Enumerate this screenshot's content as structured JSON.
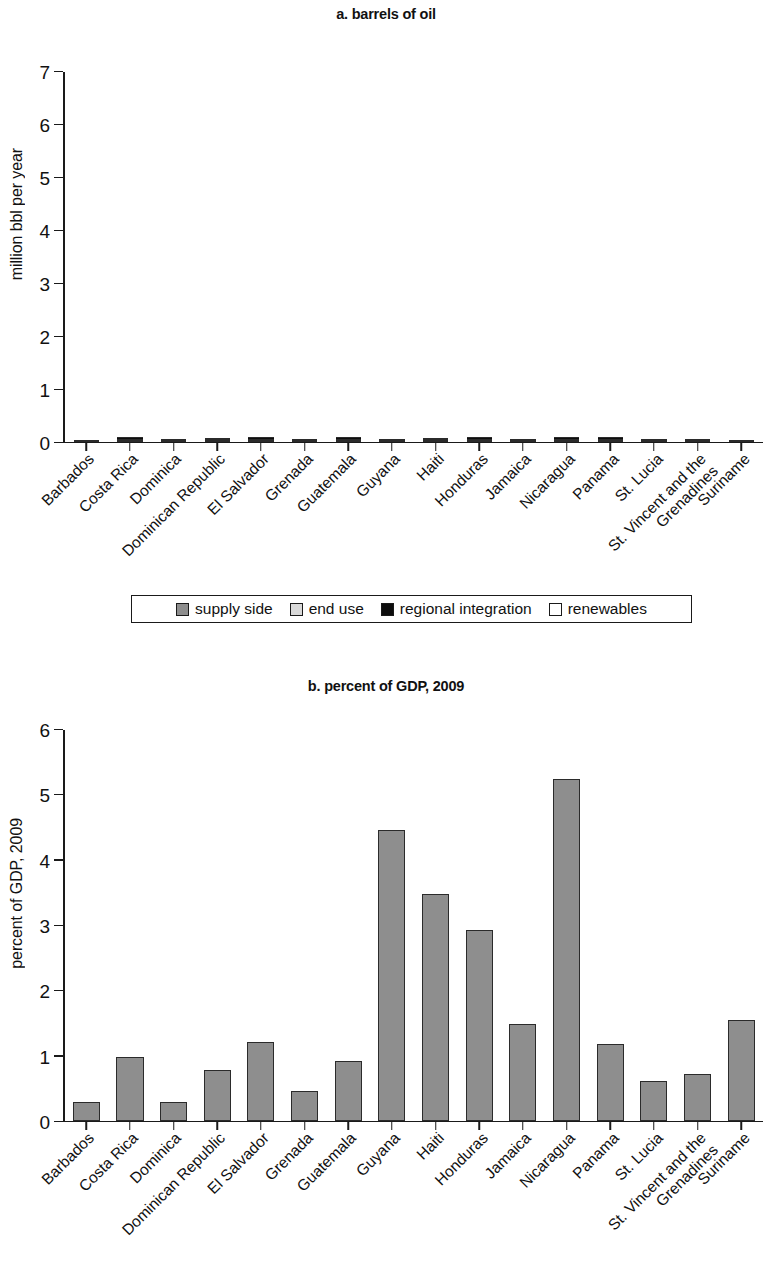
{
  "figure": {
    "panel_a_title": "a. barrels of oil",
    "panel_b_title": "b. percent of GDP, 2009"
  },
  "legend": {
    "items": [
      {
        "label": "supply side",
        "color": "#8e8e8e",
        "key": "supply"
      },
      {
        "label": "end use",
        "color": "#d9d9d9",
        "key": "end"
      },
      {
        "label": "regional integration",
        "color": "#0d0d0d",
        "key": "regional"
      },
      {
        "label": "renewables",
        "color": "#ffffff",
        "key": "renewables"
      }
    ]
  },
  "chart_data": [
    {
      "id": "a",
      "type": "bar",
      "stacked": true,
      "title": "a. barrels of oil",
      "xlabel": "",
      "ylabel": "million bbl per year",
      "ylim": [
        0,
        7
      ],
      "yticks": [
        0,
        1,
        2,
        3,
        4,
        5,
        6,
        7
      ],
      "grid": false,
      "legend_position": "bottom",
      "categories": [
        "Barbados",
        "Costa Rica",
        "Dominica",
        "Dominican Republic",
        "El Salvador",
        "Grenada",
        "Guatemala",
        "Guyana",
        "Haiti",
        "Honduras",
        "Jamaica",
        "Nicaragua",
        "Panama",
        "St. Lucia",
        "St. Vincent and the Grenadines",
        "Suriname"
      ],
      "category_lines": [
        [
          "Barbados"
        ],
        [
          "Costa Rica"
        ],
        [
          "Dominica"
        ],
        [
          "Dominican Republic"
        ],
        [
          "El Salvador"
        ],
        [
          "Grenada"
        ],
        [
          "Guatemala"
        ],
        [
          "Guyana"
        ],
        [
          "Haiti"
        ],
        [
          "Honduras"
        ],
        [
          "Jamaica"
        ],
        [
          "Nicaragua"
        ],
        [
          "Panama"
        ],
        [
          "St. Lucia"
        ],
        [
          "St. Vincent and the",
          "Grenadines"
        ],
        [
          "Suriname"
        ]
      ],
      "series": [
        {
          "name": "supply side",
          "color": "#8e8e8e",
          "values": [
            0,
            0.52,
            0.01,
            0.8,
            0.36,
            0.02,
            0.45,
            0,
            0.1,
            0.95,
            0.8,
            0.55,
            0.5,
            0.02,
            0.01,
            0
          ]
        },
        {
          "name": "end use",
          "color": "#d9d9d9",
          "values": [
            0.15,
            0.2,
            0.01,
            3.15,
            0.83,
            0.01,
            1.18,
            0.3,
            0.08,
            1.18,
            1.83,
            0.73,
            0.98,
            0.04,
            0.04,
            0.7
          ]
        },
        {
          "name": "regional integration",
          "color": "#0d0d0d",
          "values": [
            0,
            0.18,
            0,
            0,
            0.62,
            0,
            0.98,
            0,
            0,
            0.8,
            0,
            0.57,
            0.78,
            0,
            0,
            0
          ]
        },
        {
          "name": "renewables",
          "color": "#ffffff",
          "values": [
            0,
            3.1,
            0,
            1.13,
            1.79,
            0,
            2.31,
            0.97,
            2.97,
            3.07,
            0,
            2.9,
            1.74,
            0,
            0,
            0
          ]
        }
      ],
      "totals": [
        0.15,
        4.0,
        0.02,
        5.08,
        3.6,
        0.03,
        4.92,
        1.27,
        3.15,
        6.0,
        2.63,
        4.75,
        4.0,
        0.06,
        0.05,
        0.7
      ]
    },
    {
      "id": "b",
      "type": "bar",
      "stacked": false,
      "title": "b. percent of GDP, 2009",
      "xlabel": "",
      "ylabel": "percent of GDP, 2009",
      "ylim": [
        0,
        6
      ],
      "yticks": [
        0,
        1,
        2,
        3,
        4,
        5,
        6
      ],
      "grid": false,
      "bar_color": "#8e8e8e",
      "categories": [
        "Barbados",
        "Costa Rica",
        "Dominica",
        "Dominican Republic",
        "El Salvador",
        "Grenada",
        "Guatemala",
        "Guyana",
        "Haiti",
        "Honduras",
        "Jamaica",
        "Nicaragua",
        "Panama",
        "St. Lucia",
        "St. Vincent and the Grenadines",
        "Suriname"
      ],
      "category_lines": [
        [
          "Barbados"
        ],
        [
          "Costa Rica"
        ],
        [
          "Dominica"
        ],
        [
          "Dominican Republic"
        ],
        [
          "El Salvador"
        ],
        [
          "Grenada"
        ],
        [
          "Guatemala"
        ],
        [
          "Guyana"
        ],
        [
          "Haiti"
        ],
        [
          "Honduras"
        ],
        [
          "Jamaica"
        ],
        [
          "Nicaragua"
        ],
        [
          "Panama"
        ],
        [
          "St. Lucia"
        ],
        [
          "St. Vincent and the",
          "Grenadines"
        ],
        [
          "Suriname"
        ]
      ],
      "values": [
        0.28,
        0.97,
        0.29,
        0.77,
        1.21,
        0.45,
        0.92,
        4.47,
        3.48,
        2.92,
        1.48,
        5.24,
        1.17,
        0.61,
        0.71,
        1.55
      ]
    }
  ]
}
